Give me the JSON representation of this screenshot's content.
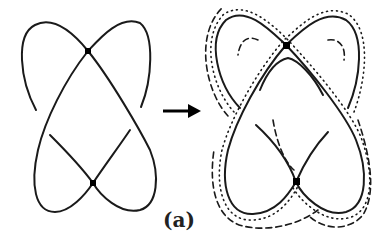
{
  "figure": {
    "label": "(a)",
    "left_diagram": {
      "nodes": 2,
      "style": "single curve"
    },
    "arrow": {
      "direction": "right"
    },
    "right_diagram": {
      "nodes": 2,
      "style": "band with solid, dotted and dashed boundary lines"
    },
    "colors": {
      "stroke": "#111111",
      "background": "#ffffff"
    }
  }
}
